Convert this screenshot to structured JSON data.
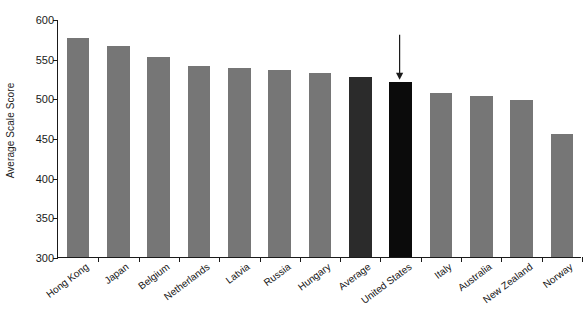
{
  "chart_data": {
    "type": "bar",
    "title": "",
    "subtitle": "",
    "xlabel": "",
    "ylabel": "Average Scale Score",
    "ylim": [
      300,
      600
    ],
    "yticks": [
      300,
      350,
      400,
      450,
      500,
      550,
      600
    ],
    "grid": false,
    "legend": "none",
    "categories": [
      "Hong Kong",
      "Japan",
      "Belgium",
      "Netherlands",
      "Latvia",
      "Russia",
      "Hungary",
      "Average",
      "United States",
      "Italy",
      "Australia",
      "New Zealand",
      "Norway"
    ],
    "values": [
      576,
      566,
      552,
      541,
      538,
      536,
      532,
      527,
      521,
      507,
      503,
      498,
      455
    ],
    "bar_colors": [
      "#767676",
      "#767676",
      "#767676",
      "#767676",
      "#767676",
      "#767676",
      "#767676",
      "#2b2b2b",
      "#0b0b0b",
      "#767676",
      "#767676",
      "#767676",
      "#767676"
    ],
    "annotations": [
      {
        "kind": "arrow",
        "points_to": "United States",
        "direction": "down",
        "color": "#1a1a1a"
      }
    ]
  },
  "colors": {
    "axis": "#1a1a1a",
    "background": "#ffffff",
    "bar_default": "#767676",
    "bar_average": "#2b2b2b",
    "bar_highlight": "#0b0b0b",
    "text": "#161616"
  }
}
